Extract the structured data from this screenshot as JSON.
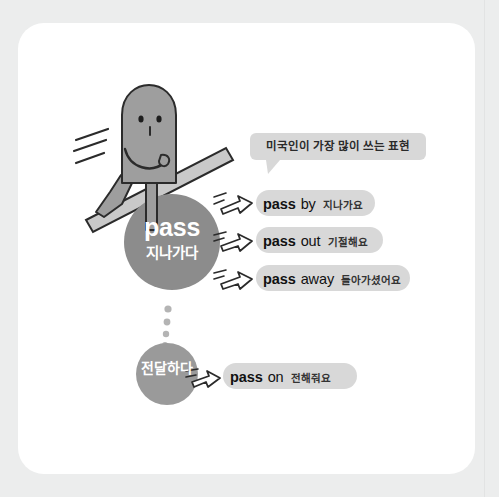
{
  "canvas": {
    "background_color": "#eceded",
    "card_color": "#ffffff"
  },
  "palette": {
    "circle_fill": "#8c8c8c",
    "circle_small_fill": "#9a9a9a",
    "pill_fill": "#d8d8d8",
    "bubble_fill": "#d8d8d8",
    "character_fill": "#9e9e9e",
    "outline": "#2b2b2b",
    "dot_color": "#b4b4b4",
    "text_on_circle": "#ffffff",
    "text_dark": "#111111"
  },
  "illustration": {
    "character_name": "walking-blob-character",
    "bar_name": "diagonal-bar",
    "motion_lines_name": "motion-lines",
    "dots_name": "vertical-dots-connector",
    "dot_count": 5
  },
  "bubble": {
    "text": "미국인이 가장 많이 쓰는 표현"
  },
  "main_circle": {
    "word": "pass",
    "meaning": "지나가다"
  },
  "sub_circle": {
    "meaning": "전달하다"
  },
  "entries": [
    {
      "verb": "pass",
      "particle": "by",
      "gloss": "지나가요"
    },
    {
      "verb": "pass",
      "particle": "out",
      "gloss": "기절해요"
    },
    {
      "verb": "pass",
      "particle": "away",
      "gloss": "돌아가셨어요"
    },
    {
      "verb": "pass",
      "particle": "on",
      "gloss": "전해줘요"
    }
  ]
}
